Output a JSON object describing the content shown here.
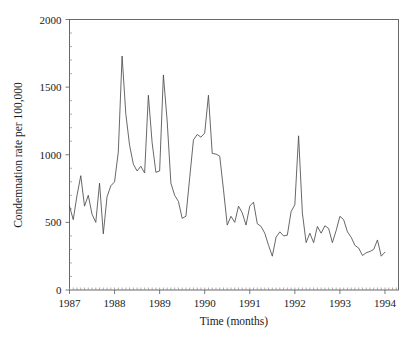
{
  "chart_data": {
    "type": "line",
    "title": "",
    "xlabel": "Time (months)",
    "ylabel": "Condemnation rate per 100,000",
    "xlim": [
      1987.0,
      1994.3
    ],
    "ylim": [
      0,
      2000
    ],
    "xticks": [
      "1987",
      "1988",
      "1989",
      "1990",
      "1991",
      "1992",
      "1993",
      "1994"
    ],
    "xtick_values": [
      1987,
      1988,
      1989,
      1990,
      1991,
      1992,
      1993,
      1994
    ],
    "yticks": [
      "0",
      "500",
      "1000",
      "1500",
      "2000"
    ],
    "ytick_values": [
      0,
      500,
      1000,
      1500,
      2000
    ],
    "grid": false,
    "legend": "none",
    "minor_ticks": "monthly",
    "series": [
      {
        "name": "Condemnation rate",
        "x": [
          1987.0,
          1987.083,
          1987.167,
          1987.25,
          1987.333,
          1987.417,
          1987.5,
          1987.583,
          1987.667,
          1987.75,
          1987.833,
          1987.917,
          1988.0,
          1988.083,
          1988.167,
          1988.25,
          1988.333,
          1988.417,
          1988.5,
          1988.583,
          1988.667,
          1988.75,
          1988.833,
          1988.917,
          1989.0,
          1989.083,
          1989.167,
          1989.25,
          1989.333,
          1989.417,
          1989.5,
          1989.583,
          1989.667,
          1989.75,
          1989.833,
          1989.917,
          1990.0,
          1990.083,
          1990.167,
          1990.25,
          1990.333,
          1990.417,
          1990.5,
          1990.583,
          1990.667,
          1990.75,
          1990.833,
          1990.917,
          1991.0,
          1991.083,
          1991.167,
          1991.25,
          1991.333,
          1991.417,
          1991.5,
          1991.583,
          1991.667,
          1991.75,
          1991.833,
          1991.917,
          1992.0,
          1992.083,
          1992.167,
          1992.25,
          1992.333,
          1992.417,
          1992.5,
          1992.583,
          1992.667,
          1992.75,
          1992.833,
          1992.917,
          1993.0,
          1993.083,
          1993.167,
          1993.25,
          1993.333,
          1993.417,
          1993.5,
          1993.583,
          1993.667,
          1993.75,
          1993.833,
          1993.917,
          1994.0
        ],
        "values": [
          620,
          520,
          700,
          845,
          620,
          700,
          560,
          500,
          790,
          415,
          690,
          770,
          800,
          1020,
          1730,
          1300,
          1070,
          930,
          880,
          915,
          865,
          1440,
          1090,
          870,
          880,
          1590,
          1250,
          790,
          700,
          655,
          530,
          545,
          830,
          1110,
          1150,
          1130,
          1160,
          1440,
          1010,
          1005,
          990,
          740,
          480,
          545,
          500,
          620,
          570,
          480,
          620,
          650,
          490,
          470,
          420,
          330,
          250,
          390,
          430,
          400,
          405,
          580,
          630,
          1140,
          570,
          350,
          420,
          350,
          470,
          420,
          475,
          455,
          350,
          440,
          545,
          520,
          430,
          390,
          330,
          310,
          255,
          275,
          285,
          300,
          370,
          250,
          280
        ]
      }
    ]
  },
  "axes": {
    "y_title": "Condemnation rate per 100,000",
    "x_title": "Time (months)"
  }
}
